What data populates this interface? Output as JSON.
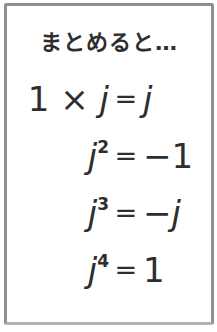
{
  "note": {
    "title": "まとめると…",
    "equals_sign": "=",
    "equations": [
      {
        "lhs_pre": "1 × ",
        "lhs_var": "j",
        "exp": "",
        "eq": "=",
        "rhs_pre": "",
        "rhs_var": "j"
      },
      {
        "lhs_pre": "",
        "lhs_var": "j",
        "exp": "2",
        "eq": "=",
        "rhs_pre": "−1",
        "rhs_var": ""
      },
      {
        "lhs_pre": "",
        "lhs_var": "j",
        "exp": "3",
        "eq": "=",
        "rhs_pre": "−",
        "rhs_var": "j"
      },
      {
        "lhs_pre": "",
        "lhs_var": "j",
        "exp": "4",
        "eq": "=",
        "rhs_pre": "1",
        "rhs_var": ""
      }
    ],
    "colors": {
      "ink": "#2e2e2e",
      "border": "#8f8f8f",
      "background": "#ffffff"
    }
  }
}
